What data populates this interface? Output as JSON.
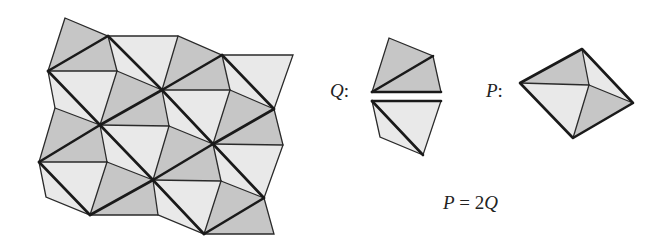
{
  "figure": {
    "colors": {
      "dark": "#c6c6c6",
      "light": "#e9e9e9",
      "line": "#1a1a1a"
    },
    "labels": {
      "q_label": "Q",
      "q_colon": ":",
      "p_label": "P",
      "p_colon": ":",
      "equation_lhs": "P",
      "equation_eq": " = 2",
      "equation_rhs": "Q"
    },
    "tiling": {
      "vertices": {
        "A": [
          65,
          18
        ],
        "B": [
          108,
          36
        ],
        "C": [
          178,
          36
        ],
        "D": [
          222,
          55
        ],
        "E": [
          293,
          55
        ],
        "F": [
          48,
          71
        ],
        "G": [
          117,
          71
        ],
        "H": [
          162,
          90
        ],
        "I": [
          230,
          90
        ],
        "J": [
          274,
          109
        ],
        "c1": [
          55,
          108
        ],
        "K": [
          100,
          125
        ],
        "L": [
          169,
          126
        ],
        "M": [
          213,
          144
        ],
        "N": [
          283,
          145
        ],
        "O": [
          39,
          162
        ],
        "P": [
          107,
          162
        ],
        "Q": [
          153,
          180
        ],
        "R": [
          221,
          181
        ],
        "S": [
          264,
          198
        ],
        "c2": [
          46,
          197
        ],
        "T": [
          90,
          215
        ],
        "U": [
          158,
          215
        ],
        "V": [
          204,
          234
        ],
        "W": [
          274,
          234
        ]
      },
      "triangles": [
        {
          "v": [
            "A",
            "B",
            "F"
          ],
          "shade": "dark"
        },
        {
          "v": [
            "F",
            "B",
            "G"
          ],
          "shade": "dark"
        },
        {
          "v": [
            "B",
            "H",
            "G"
          ],
          "shade": "light"
        },
        {
          "v": [
            "G",
            "H",
            "K"
          ],
          "shade": "dark"
        },
        {
          "v": [
            "F",
            "G",
            "K"
          ],
          "shade": "light"
        },
        {
          "v": [
            "B",
            "C",
            "H"
          ],
          "shade": "light"
        },
        {
          "v": [
            "C",
            "D",
            "H"
          ],
          "shade": "dark"
        },
        {
          "v": [
            "D",
            "E",
            "J"
          ],
          "shade": "light"
        },
        {
          "v": [
            "H",
            "D",
            "I"
          ],
          "shade": "dark"
        },
        {
          "v": [
            "D",
            "J",
            "I"
          ],
          "shade": "light"
        },
        {
          "v": [
            "I",
            "J",
            "M"
          ],
          "shade": "dark"
        },
        {
          "v": [
            "H",
            "I",
            "M"
          ],
          "shade": "light"
        },
        {
          "v": [
            "F",
            "K",
            "c1"
          ],
          "shade": "light"
        },
        {
          "v": [
            "c1",
            "K",
            "O"
          ],
          "shade": "dark"
        },
        {
          "v": [
            "K",
            "H",
            "L"
          ],
          "shade": "dark"
        },
        {
          "v": [
            "H",
            "M",
            "L"
          ],
          "shade": "light"
        },
        {
          "v": [
            "L",
            "M",
            "Q"
          ],
          "shade": "dark"
        },
        {
          "v": [
            "K",
            "L",
            "Q"
          ],
          "shade": "light"
        },
        {
          "v": [
            "M",
            "J",
            "N"
          ],
          "shade": "dark"
        },
        {
          "v": [
            "M",
            "N",
            "S"
          ],
          "shade": "light"
        },
        {
          "v": [
            "O",
            "K",
            "P"
          ],
          "shade": "dark"
        },
        {
          "v": [
            "K",
            "Q",
            "P"
          ],
          "shade": "light"
        },
        {
          "v": [
            "P",
            "Q",
            "T"
          ],
          "shade": "dark"
        },
        {
          "v": [
            "O",
            "P",
            "T"
          ],
          "shade": "light"
        },
        {
          "v": [
            "O",
            "T",
            "c2"
          ],
          "shade": "light"
        },
        {
          "v": [
            "Q",
            "M",
            "R"
          ],
          "shade": "dark"
        },
        {
          "v": [
            "M",
            "S",
            "R"
          ],
          "shade": "light"
        },
        {
          "v": [
            "R",
            "S",
            "V"
          ],
          "shade": "dark"
        },
        {
          "v": [
            "Q",
            "R",
            "V"
          ],
          "shade": "light"
        },
        {
          "v": [
            "T",
            "Q",
            "U"
          ],
          "shade": "dark"
        },
        {
          "v": [
            "Q",
            "V",
            "U"
          ],
          "shade": "light"
        },
        {
          "v": [
            "V",
            "S",
            "W"
          ],
          "shade": "dark"
        }
      ]
    },
    "piece_q": {
      "top_half": {
        "points": [
          [
            389,
            38
          ],
          [
            433,
            56
          ],
          [
            441,
            92
          ],
          [
            372,
            92
          ]
        ],
        "diagonal": [
          [
            372,
            92
          ],
          [
            433,
            56
          ]
        ]
      },
      "bottom_half": {
        "points": [
          [
            372,
            101
          ],
          [
            441,
            101
          ],
          [
            423,
            155
          ],
          [
            380,
            137
          ]
        ],
        "diagonal": [
          [
            372,
            101
          ],
          [
            423,
            155
          ]
        ]
      }
    },
    "piece_p": {
      "left": [
        520,
        83
      ],
      "top": [
        582,
        49
      ],
      "right": [
        633,
        103
      ],
      "bottom": [
        573,
        138
      ],
      "center": [
        589,
        85
      ]
    }
  }
}
